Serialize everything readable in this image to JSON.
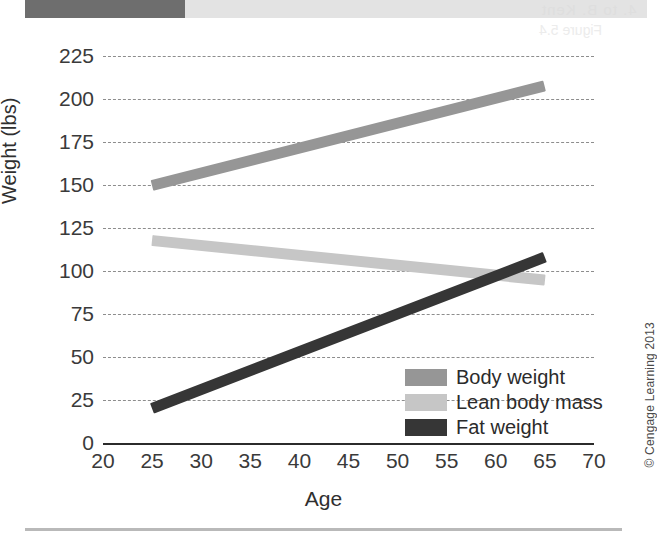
{
  "page": {
    "credit": "© Cengage Learning 2013",
    "bleed_text_top": "4. to B. Kent",
    "bleed_text_second": "Figure 5.4",
    "artifact_bar_dark_color": "#6e6e6e",
    "artifact_bar_light_color": "#e3e3e3"
  },
  "chart_data": {
    "type": "line",
    "title": "",
    "subtitle": "",
    "xlabel": "Age",
    "ylabel": "Weight (lbs)",
    "xlim": [
      20,
      70
    ],
    "ylim": [
      0,
      225
    ],
    "xticks": [
      20,
      25,
      30,
      35,
      40,
      45,
      50,
      55,
      60,
      65,
      70
    ],
    "yticks": [
      0,
      25,
      50,
      75,
      100,
      125,
      150,
      175,
      200,
      225
    ],
    "grid": "horizontal-dashed",
    "legend_position": "lower-right-inside",
    "series": [
      {
        "name": "Body weight",
        "color": "#969696",
        "x": [
          25,
          65
        ],
        "values": [
          150,
          208
        ]
      },
      {
        "name": "Lean body mass",
        "color": "#c6c6c6",
        "x": [
          25,
          65
        ],
        "values": [
          118,
          95
        ]
      },
      {
        "name": "Fat weight",
        "color": "#363636",
        "x": [
          25,
          65
        ],
        "values": [
          20,
          108
        ]
      }
    ],
    "annotations": []
  },
  "axis": {
    "y_title": "Weight (lbs)",
    "x_title": "Age",
    "y_labels": [
      "225",
      "200",
      "175",
      "150",
      "125",
      "100",
      "75",
      "50",
      "25",
      "0"
    ],
    "x_labels": [
      "20",
      "25",
      "30",
      "35",
      "40",
      "45",
      "50",
      "55",
      "60",
      "65",
      "70"
    ]
  },
  "legend": {
    "items": [
      {
        "label": "Body weight",
        "color": "#969696"
      },
      {
        "label": "Lean body mass",
        "color": "#c6c6c6"
      },
      {
        "label": "Fat weight",
        "color": "#363636"
      }
    ]
  }
}
